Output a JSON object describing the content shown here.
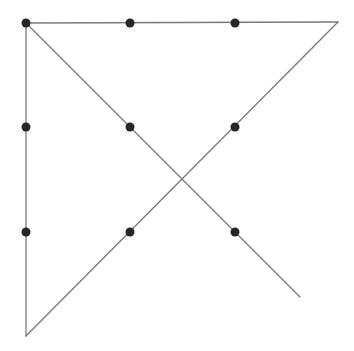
{
  "diagram": {
    "type": "nine-dots-puzzle-solution",
    "background": "#ffffff",
    "line_color": "#7a7a7a",
    "dot_color": "#262626",
    "dot_radius": 4.5,
    "dots": [
      {
        "x": 26,
        "y": 23
      },
      {
        "x": 130,
        "y": 23
      },
      {
        "x": 235,
        "y": 23
      },
      {
        "x": 26,
        "y": 127
      },
      {
        "x": 130,
        "y": 127
      },
      {
        "x": 235,
        "y": 127
      },
      {
        "x": 26,
        "y": 232
      },
      {
        "x": 130,
        "y": 232
      },
      {
        "x": 235,
        "y": 232
      }
    ],
    "lines": [
      {
        "name": "top-horizontal-line",
        "x1": 26,
        "y1": 23,
        "x2": 338,
        "y2": 22
      },
      {
        "name": "rising-diagonal-line",
        "x1": 338,
        "y1": 22,
        "x2": 26,
        "y2": 336
      },
      {
        "name": "left-vertical-line",
        "x1": 26,
        "y1": 336,
        "x2": 26,
        "y2": 23
      },
      {
        "name": "falling-diagonal-line",
        "x1": 26,
        "y1": 23,
        "x2": 300,
        "y2": 297
      }
    ]
  }
}
